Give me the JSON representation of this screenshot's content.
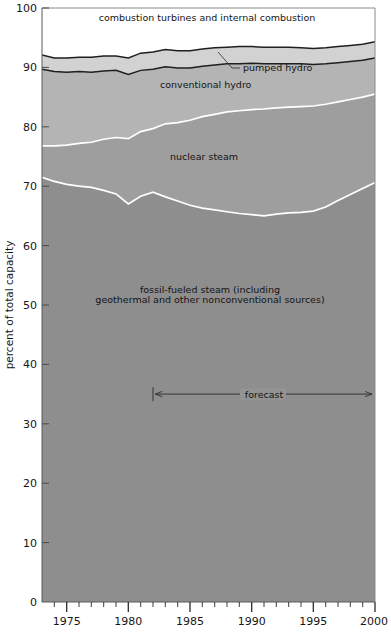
{
  "chart_data": {
    "type": "area",
    "title": "",
    "subtitle": "",
    "xlabel": "",
    "ylabel": "percent of total capacity",
    "xlim": [
      1973,
      2000
    ],
    "ylim": [
      0,
      100
    ],
    "grid": false,
    "legend_position": "inline-annotations",
    "stacked": true,
    "normalized_to_percent": true,
    "x_tick_labels": [
      "1975",
      "1980",
      "1985",
      "1990",
      "1995",
      "2000"
    ],
    "x_major_ticks": [
      1975,
      1980,
      1985,
      1990,
      1995,
      2000
    ],
    "x_minor_tick_interval": 1,
    "y_tick_labels": [
      "0",
      "10",
      "20",
      "30",
      "40",
      "50",
      "60",
      "70",
      "80",
      "90",
      "100"
    ],
    "y_major_ticks": [
      0,
      10,
      20,
      30,
      40,
      50,
      60,
      70,
      80,
      90,
      100
    ],
    "x": [
      1973,
      1974,
      1975,
      1976,
      1977,
      1978,
      1979,
      1980,
      1981,
      1982,
      1983,
      1984,
      1985,
      1986,
      1987,
      1988,
      1989,
      1990,
      1991,
      1992,
      1993,
      1994,
      1995,
      1996,
      1997,
      1998,
      1999,
      2000
    ],
    "series": [
      {
        "name": "fossil-fueled steam (including geothermal and other nonconventional sources)",
        "short_name": "fossil-fueled steam",
        "color": "#8e8e8e",
        "stack_order": 1,
        "values": [
          71.5,
          70.8,
          70.3,
          70.0,
          69.8,
          69.3,
          68.7,
          67.0,
          68.3,
          69.0,
          68.2,
          67.5,
          66.8,
          66.3,
          66.0,
          65.7,
          65.4,
          65.2,
          65.0,
          65.3,
          65.5,
          65.6,
          65.8,
          66.5,
          67.6,
          68.6,
          69.6,
          70.6
        ]
      },
      {
        "name": "nuclear steam",
        "short_name": "nuclear steam",
        "color": "#9e9e9e",
        "stack_order": 2,
        "values": [
          5.3,
          6.0,
          6.6,
          7.2,
          7.6,
          8.6,
          9.5,
          11.0,
          10.9,
          10.7,
          12.3,
          13.2,
          14.3,
          15.4,
          16.1,
          16.8,
          17.3,
          17.7,
          18.0,
          17.9,
          17.8,
          17.8,
          17.7,
          17.3,
          16.6,
          16.0,
          15.4,
          14.9
        ]
      },
      {
        "name": "conventional hydro",
        "short_name": "conventional hydro",
        "color": "#b4b4b4",
        "stack_order": 3,
        "values": [
          12.9,
          12.5,
          12.3,
          12.1,
          11.8,
          11.5,
          11.3,
          10.8,
          10.3,
          10.0,
          9.6,
          9.2,
          8.8,
          8.5,
          8.3,
          8.1,
          7.9,
          7.8,
          7.6,
          7.4,
          7.3,
          7.2,
          7.0,
          6.8,
          6.6,
          6.4,
          6.2,
          6.1
        ]
      },
      {
        "name": "pumped hydro",
        "short_name": "pumped hydro",
        "color": "#d2d2d2",
        "stack_order": 4,
        "values": [
          2.4,
          2.3,
          2.4,
          2.4,
          2.5,
          2.5,
          2.4,
          2.8,
          2.9,
          2.9,
          2.9,
          2.9,
          2.9,
          2.9,
          2.9,
          2.8,
          2.9,
          2.8,
          2.8,
          2.8,
          2.8,
          2.7,
          2.7,
          2.7,
          2.7,
          2.7,
          2.7,
          2.7
        ]
      },
      {
        "name": "combustion turbines and internal combustion",
        "short_name": "combustion turbines and internal combustion",
        "color": "#ffffff",
        "stack_order": 5,
        "values": [
          7.9,
          8.4,
          8.4,
          8.3,
          8.3,
          8.1,
          8.1,
          8.4,
          7.6,
          7.4,
          7.0,
          7.2,
          7.2,
          6.9,
          6.7,
          6.6,
          6.5,
          6.5,
          6.6,
          6.6,
          6.6,
          6.7,
          6.8,
          6.7,
          6.5,
          6.3,
          6.1,
          5.7
        ]
      }
    ],
    "cumulative_boundaries": {
      "note": "stacked upper boundary of each series, percent of total capacity",
      "fossil_top": [
        71.5,
        70.8,
        70.3,
        70.0,
        69.8,
        69.3,
        68.7,
        67.0,
        68.3,
        69.0,
        68.2,
        67.5,
        66.8,
        66.3,
        66.0,
        65.7,
        65.4,
        65.2,
        65.0,
        65.3,
        65.5,
        65.6,
        65.8,
        66.5,
        67.6,
        68.6,
        69.6,
        70.6
      ],
      "nuclear_top": [
        76.8,
        76.8,
        76.9,
        77.2,
        77.4,
        77.9,
        78.2,
        78.0,
        79.2,
        79.7,
        80.5,
        80.7,
        81.1,
        81.7,
        82.1,
        82.5,
        82.7,
        82.9,
        83.0,
        83.2,
        83.3,
        83.4,
        83.5,
        83.8,
        84.2,
        84.6,
        85.0,
        85.5
      ],
      "conv_hydro_top": [
        89.7,
        89.3,
        89.2,
        89.3,
        89.2,
        89.4,
        89.5,
        88.8,
        89.5,
        89.7,
        90.1,
        89.9,
        89.9,
        90.2,
        90.4,
        90.6,
        90.6,
        90.7,
        90.6,
        90.6,
        90.6,
        90.6,
        90.5,
        90.6,
        90.8,
        91.0,
        91.2,
        91.6
      ],
      "pumped_hydro_top": [
        92.1,
        91.6,
        91.6,
        91.7,
        91.7,
        91.9,
        91.9,
        91.6,
        92.4,
        92.6,
        93.0,
        92.8,
        92.8,
        93.1,
        93.3,
        93.4,
        93.5,
        93.5,
        93.4,
        93.4,
        93.4,
        93.3,
        93.2,
        93.3,
        93.5,
        93.7,
        93.9,
        94.3
      ],
      "total_top": [
        100,
        100,
        100,
        100,
        100,
        100,
        100,
        100,
        100,
        100,
        100,
        100,
        100,
        100,
        100,
        100,
        100,
        100,
        100,
        100,
        100,
        100,
        100,
        100,
        100,
        100,
        100,
        100
      ]
    },
    "annotations": [
      {
        "name": "forecast-arrow",
        "text": "forecast",
        "x_start": 1982,
        "x_end": 2000,
        "y": 35,
        "style": "double-headed-arrow"
      },
      {
        "name": "pumped-hydro-leader",
        "text": "pumped hydro",
        "style": "leader-line"
      }
    ],
    "colors": {
      "plot_frame": "#4a4a4a",
      "boundary_dark": "#1f1f1f",
      "boundary_light": "#ffffff",
      "fossil_fill": "#8e8e8e",
      "nuclear_fill": "#9e9e9e",
      "conventional_hydro_fill": "#b4b4b4",
      "pumped_hydro_fill": "#d2d2d2",
      "combustion_fill": "#ffffff",
      "text": "#161616"
    }
  },
  "axes": {
    "y_label": "percent of total capacity",
    "y_ticks": [
      {
        "value": "100",
        "pos": 100
      },
      {
        "value": "90",
        "pos": 90
      },
      {
        "value": "80",
        "pos": 80
      },
      {
        "value": "70",
        "pos": 70
      },
      {
        "value": "60",
        "pos": 60
      },
      {
        "value": "50",
        "pos": 50
      },
      {
        "value": "40",
        "pos": 40
      },
      {
        "value": "30",
        "pos": 30
      },
      {
        "value": "20",
        "pos": 20
      },
      {
        "value": "10",
        "pos": 10
      },
      {
        "value": "0",
        "pos": 0
      }
    ],
    "x_ticks": [
      {
        "value": "1975",
        "pos": 1975
      },
      {
        "value": "1980",
        "pos": 1980
      },
      {
        "value": "1985",
        "pos": 1985
      },
      {
        "value": "1990",
        "pos": 1990
      },
      {
        "value": "1995",
        "pos": 1995
      },
      {
        "value": "2000",
        "pos": 2000
      }
    ]
  },
  "labels": {
    "combustion": "combustion turbines and internal combustion",
    "pumped_hydro": "pumped hydro",
    "conventional_hydro": "conventional hydro",
    "nuclear_steam": "nuclear steam",
    "fossil_line1": "fossil-fueled steam (including",
    "fossil_line2": "geothermal and other nonconventional sources)",
    "forecast": "forecast"
  }
}
